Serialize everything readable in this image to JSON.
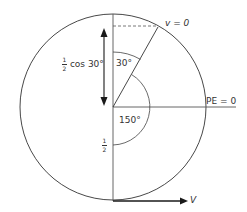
{
  "diagram": {
    "type": "vertical-circle-motion",
    "colors": {
      "stroke": "#333333",
      "background": "#ffffff"
    },
    "labels": {
      "top_point": "v = 0",
      "right_point": "PE = 0",
      "bottom_arrow": "V",
      "angle_top": "30°",
      "angle_large": "150°",
      "height_label_num": "1",
      "height_label_den": "2",
      "height_label_text": "cos 30°",
      "radius_label_num": "1",
      "radius_label_den": "2"
    }
  }
}
